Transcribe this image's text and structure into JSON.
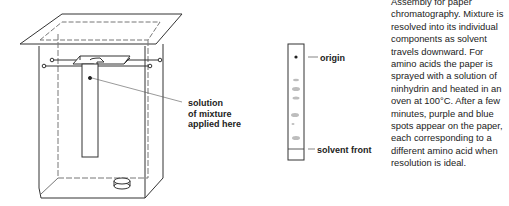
{
  "diagram": {
    "title": "Assembly for paper chromatography",
    "labels": {
      "application_point": [
        "solution",
        "of mixture",
        "applied here"
      ],
      "origin": "origin",
      "solvent_front": "solvent front"
    },
    "caption": "Assembly for paper chromatography. Mixture is resolved into its individual components as solvent travels downward. For amino acids the paper is sprayed with a solution of ninhydrin and heated in an oven at 100°C. After a few minutes, purple and blue spots appear on the paper, each corresponding to a different amino acid when resolution is ideal.",
    "strip_spots": 6,
    "colors": {
      "line": "#333333",
      "spot": "#b5b5b5",
      "text": "#222222"
    }
  }
}
